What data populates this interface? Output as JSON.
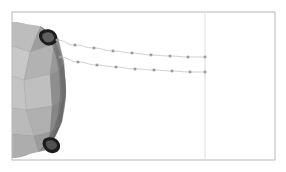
{
  "canvas": {
    "width": 286,
    "height": 172,
    "background": "#ffffff"
  },
  "frame": {
    "label": "render-viewport-frame",
    "x": 12,
    "y": 12,
    "width": 263,
    "height": 148,
    "border_color": "#b8b8b8",
    "fill": "#ffffff"
  },
  "scene": {
    "title": "faceted-sphere-trajectory-render",
    "objects": [
      {
        "name": "faceted-sphere",
        "kind": "low-poly-sphere",
        "center_x": 18,
        "center_y": 90,
        "radius_x": 48,
        "radius_y": 68,
        "clipped_edge": "left",
        "palette": {
          "lightest": "#cfcfcf",
          "light": "#c2c2c2",
          "mid_light": "#b4b4b4",
          "mid": "#a6a6a6",
          "mid_dark": "#939393",
          "dark": "#7f7f7f",
          "darkest": "#6a6a6a",
          "rim": "#5c5c5c",
          "facet_edge": "#8a8a8a"
        }
      },
      {
        "name": "upper-spike-marker",
        "kind": "dark-teardrop-protrusion",
        "x": 47,
        "y": 36,
        "fill": "#1a1a1a",
        "inner_fill": "#5a5a5a"
      },
      {
        "name": "lower-spike-marker",
        "kind": "dark-teardrop-protrusion",
        "x": 51,
        "y": 145,
        "fill": "#1a1a1a",
        "inner_fill": "#4d4d4d"
      }
    ]
  },
  "chart_data": {
    "type": "line",
    "title": "",
    "xlabel": "",
    "ylabel": "",
    "grid": false,
    "legend": null,
    "axis_line": {
      "name": "vertical-reference-line",
      "orientation": "vertical",
      "x": 205,
      "y_start": 13,
      "y_end": 159,
      "color": "#dcdcdc"
    },
    "series": [
      {
        "name": "upper-trajectory",
        "color": "#c3c3c3",
        "marker": "square",
        "marker_color": "#9a9a9a",
        "points": [
          {
            "x": 57,
            "y": 40
          },
          {
            "x": 75,
            "y": 45
          },
          {
            "x": 94,
            "y": 48
          },
          {
            "x": 113,
            "y": 51
          },
          {
            "x": 132,
            "y": 53
          },
          {
            "x": 151,
            "y": 55
          },
          {
            "x": 170,
            "y": 56
          },
          {
            "x": 188,
            "y": 57
          },
          {
            "x": 205,
            "y": 57
          }
        ]
      },
      {
        "name": "lower-trajectory",
        "color": "#c3c3c3",
        "marker": "square",
        "marker_color": "#9a9a9a",
        "points": [
          {
            "x": 60,
            "y": 57
          },
          {
            "x": 78,
            "y": 62
          },
          {
            "x": 97,
            "y": 65
          },
          {
            "x": 116,
            "y": 67
          },
          {
            "x": 135,
            "y": 69
          },
          {
            "x": 154,
            "y": 70
          },
          {
            "x": 172,
            "y": 71
          },
          {
            "x": 190,
            "y": 72
          },
          {
            "x": 205,
            "y": 72
          }
        ]
      }
    ]
  }
}
